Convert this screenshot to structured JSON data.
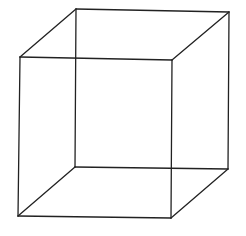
{
  "figure": {
    "type": "necker-cube-wireframe",
    "background": "#ffffff",
    "stroke_color": "#222222"
  },
  "vertices": {
    "front_top_left": [
      20,
      57
    ],
    "front_top_right": [
      172,
      60
    ],
    "front_bottom_left": [
      18,
      216
    ],
    "front_bottom_right": [
      171,
      218
    ],
    "back_top_left": [
      76,
      9
    ],
    "back_top_right": [
      229,
      12
    ],
    "back_bottom_left": [
      75,
      167
    ],
    "back_bottom_right": [
      228,
      169
    ]
  },
  "edges": [
    [
      "front_top_left",
      "front_top_right"
    ],
    [
      "front_top_right",
      "front_bottom_right"
    ],
    [
      "front_bottom_right",
      "front_bottom_left"
    ],
    [
      "front_bottom_left",
      "front_top_left"
    ],
    [
      "back_top_left",
      "back_top_right"
    ],
    [
      "back_top_right",
      "back_bottom_right"
    ],
    [
      "back_bottom_right",
      "back_bottom_left"
    ],
    [
      "back_bottom_left",
      "back_top_left"
    ],
    [
      "front_top_left",
      "back_top_left"
    ],
    [
      "front_top_right",
      "back_top_right"
    ],
    [
      "front_bottom_left",
      "back_bottom_left"
    ],
    [
      "front_bottom_right",
      "back_bottom_right"
    ]
  ]
}
